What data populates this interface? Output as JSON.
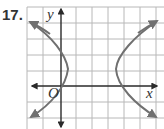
{
  "problem": {
    "number": "17."
  },
  "graph": {
    "type": "hyperbola",
    "axis_labels": {
      "x": "x",
      "y": "y",
      "origin": "O"
    },
    "colors": {
      "grid": "#b8b8b8",
      "axis": "#2a2a2a",
      "curve": "#707070"
    },
    "grid": {
      "columns": 8,
      "rows": 8,
      "cell_px": 16
    },
    "branches": [
      "left",
      "right"
    ],
    "vertices_grid": [
      [
        1,
        3
      ],
      [
        5,
        3
      ]
    ],
    "center_grid": [
      3,
      3
    ]
  }
}
